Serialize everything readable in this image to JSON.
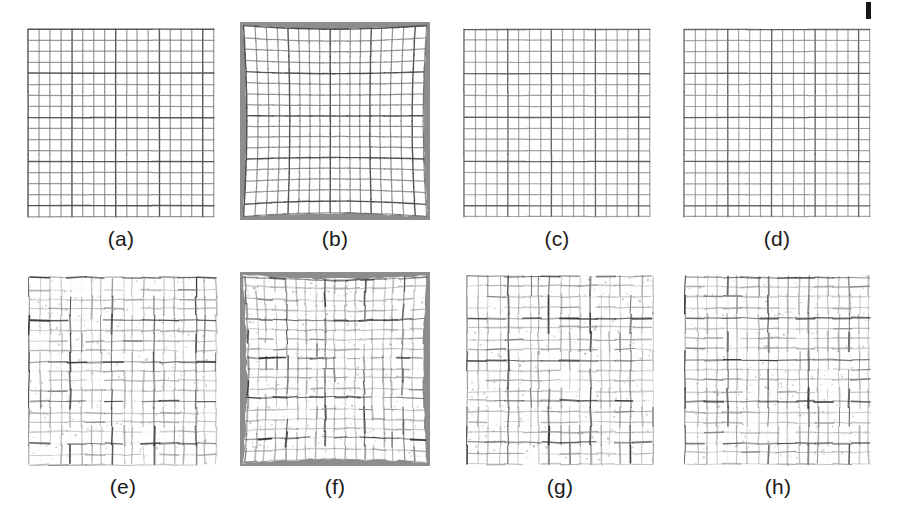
{
  "figure": {
    "background_color": "#ffffff",
    "width": 899,
    "height": 526,
    "caption_color": "#1a1a1a",
    "caption_font_size": 21,
    "page_mark": {
      "name": "page-edge-mark",
      "x": 866,
      "y": 2,
      "width": 5,
      "height": 17,
      "color": "#161616"
    }
  },
  "chart_data": {
    "type": "table",
    "title": "",
    "xlabel": "",
    "ylabel": "",
    "rows": 2,
    "columns": 4,
    "panel_labels": [
      "(a)",
      "(b)",
      "(c)",
      "(d)",
      "(e)",
      "(f)",
      "(g)",
      "(h)"
    ]
  },
  "panels": [
    {
      "id": "a",
      "label": "(a)",
      "x": 26,
      "y": 27,
      "w": 190,
      "h": 192,
      "caption_x": 26,
      "caption_y": 228,
      "caption_w": 190,
      "cells": 17,
      "line_color": "#6f6f6f",
      "line_color_strong": "#4a4a4a",
      "line_width": 1.25,
      "jitter": 0.25,
      "noise": 0.05,
      "warped": false,
      "border_color": "",
      "seed": 11,
      "kind": "clean-grid"
    },
    {
      "id": "b",
      "label": "(b)",
      "x": 240,
      "y": 22,
      "w": 190,
      "h": 198,
      "caption_x": 240,
      "caption_y": 228,
      "caption_w": 190,
      "cells": 17,
      "line_color": "#6a6a6a",
      "line_color_strong": "#454545",
      "line_width": 1.25,
      "jitter": 0.3,
      "noise": 0.08,
      "warped": true,
      "border_color": "#8d8d8d",
      "seed": 23,
      "kind": "warped-grid-with-border"
    },
    {
      "id": "c",
      "label": "(c)",
      "x": 462,
      "y": 27,
      "w": 190,
      "h": 192,
      "caption_x": 462,
      "caption_y": 228,
      "caption_w": 190,
      "cells": 17,
      "line_color": "#7c7c7c",
      "line_color_strong": "#585858",
      "line_width": 1.2,
      "jitter": 0.3,
      "noise": 0.08,
      "warped": false,
      "border_color": "",
      "seed": 37,
      "kind": "clean-grid"
    },
    {
      "id": "d",
      "label": "(d)",
      "x": 682,
      "y": 27,
      "w": 190,
      "h": 192,
      "caption_x": 682,
      "caption_y": 228,
      "caption_w": 190,
      "cells": 17,
      "line_color": "#7c7c7c",
      "line_color_strong": "#585858",
      "line_width": 1.2,
      "jitter": 0.3,
      "noise": 0.08,
      "warped": false,
      "border_color": "",
      "seed": 53,
      "kind": "clean-grid"
    },
    {
      "id": "e",
      "label": "(e)",
      "x": 28,
      "y": 276,
      "w": 190,
      "h": 190,
      "caption_x": 28,
      "caption_y": 476,
      "caption_w": 190,
      "cells": 18,
      "line_color": "#8a8a8a",
      "line_color_strong": "#3c3c3c",
      "line_width": 1.15,
      "jitter": 1.5,
      "noise": 0.72,
      "warped": false,
      "border_color": "",
      "seed": 71,
      "kind": "noisy-grid"
    },
    {
      "id": "f",
      "label": "(f)",
      "x": 240,
      "y": 272,
      "w": 190,
      "h": 194,
      "caption_x": 240,
      "caption_y": 476,
      "caption_w": 190,
      "cells": 18,
      "line_color": "#8a8a8a",
      "line_color_strong": "#3c3c3c",
      "line_width": 1.15,
      "jitter": 1.4,
      "noise": 0.7,
      "warped": true,
      "border_color": "#8d8d8d",
      "seed": 89,
      "kind": "warped-noisy-grid-with-border"
    },
    {
      "id": "g",
      "label": "(g)",
      "x": 466,
      "y": 274,
      "w": 188,
      "h": 192,
      "caption_x": 466,
      "caption_y": 476,
      "caption_w": 188,
      "cells": 18,
      "line_color": "#858585",
      "line_color_strong": "#383838",
      "line_width": 1.15,
      "jitter": 1.45,
      "noise": 0.74,
      "warped": false,
      "border_color": "",
      "seed": 101,
      "kind": "noisy-grid"
    },
    {
      "id": "h",
      "label": "(h)",
      "x": 684,
      "y": 274,
      "w": 188,
      "h": 192,
      "caption_x": 684,
      "caption_y": 476,
      "caption_w": 188,
      "cells": 18,
      "line_color": "#8a8a8a",
      "line_color_strong": "#3e3e3e",
      "line_width": 1.15,
      "jitter": 1.4,
      "noise": 0.7,
      "warped": false,
      "border_color": "",
      "seed": 127,
      "kind": "noisy-grid"
    }
  ]
}
